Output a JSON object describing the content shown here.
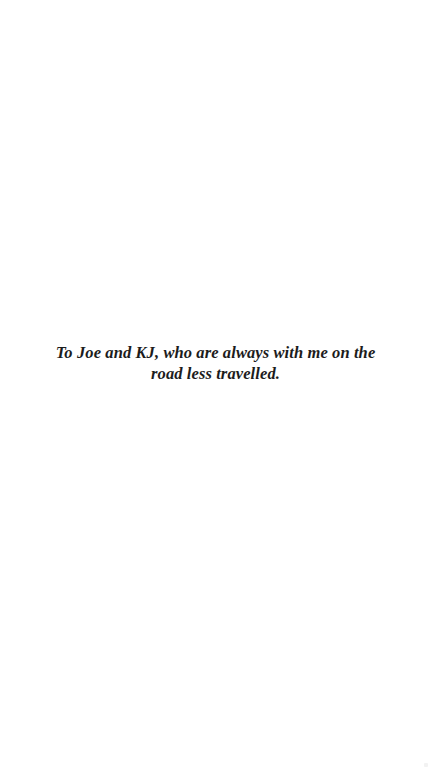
{
  "page": {
    "background": "#ffffff",
    "text_color": "#1c1c1c"
  },
  "dedication": {
    "lines": [
      "To Joe and KJ, who are always with me on the",
      "road less travelled."
    ]
  }
}
